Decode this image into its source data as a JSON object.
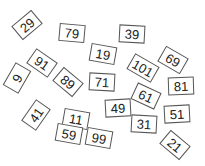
{
  "cards": [
    {
      "label": "29",
      "x": 27,
      "y": 25,
      "rot": -40
    },
    {
      "label": "79",
      "x": 72,
      "y": 33,
      "rot": 5
    },
    {
      "label": "39",
      "x": 132,
      "y": 34,
      "rot": 3
    },
    {
      "label": "19",
      "x": 103,
      "y": 54,
      "rot": 10
    },
    {
      "label": "69",
      "x": 173,
      "y": 60,
      "rot": 30
    },
    {
      "label": "91",
      "x": 42,
      "y": 63,
      "rot": 35
    },
    {
      "label": "101",
      "x": 143,
      "y": 68,
      "rot": 30
    },
    {
      "label": "9",
      "x": 17,
      "y": 78,
      "rot": -60
    },
    {
      "label": "89",
      "x": 68,
      "y": 82,
      "rot": 40
    },
    {
      "label": "71",
      "x": 102,
      "y": 82,
      "rot": 3
    },
    {
      "label": "81",
      "x": 181,
      "y": 86,
      "rot": -2
    },
    {
      "label": "61",
      "x": 146,
      "y": 96,
      "rot": 25
    },
    {
      "label": "49",
      "x": 118,
      "y": 108,
      "rot": -3
    },
    {
      "label": "51",
      "x": 177,
      "y": 114,
      "rot": -3
    },
    {
      "label": "41",
      "x": 36,
      "y": 115,
      "rot": -55
    },
    {
      "label": "11",
      "x": 76,
      "y": 119,
      "rot": 10
    },
    {
      "label": "31",
      "x": 144,
      "y": 124,
      "rot": 3
    },
    {
      "label": "59",
      "x": 69,
      "y": 134,
      "rot": 10
    },
    {
      "label": "99",
      "x": 99,
      "y": 138,
      "rot": 10
    },
    {
      "label": "21",
      "x": 175,
      "y": 145,
      "rot": 40
    }
  ],
  "colors": {
    "background": "#ffffff",
    "card_border": "#555555",
    "card_text": "#222222"
  }
}
